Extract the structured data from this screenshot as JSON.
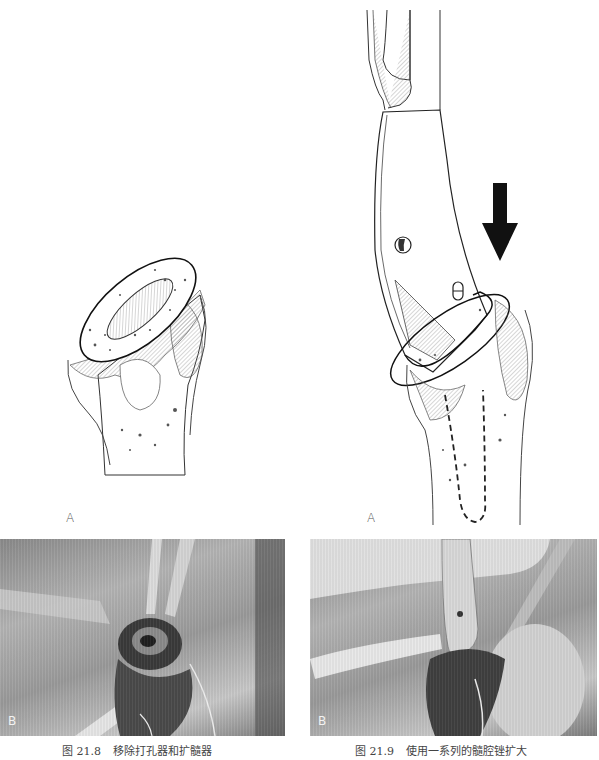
{
  "figures": [
    {
      "id": "21.8",
      "panel_a_label": "A",
      "panel_b_label": "B",
      "caption_prefix": "图 21.8",
      "caption_text": "移除打孔器和扩髓器",
      "drawing_subject": "proximal-humerus-bone-with-opened-canal",
      "photo_subject": "intraoperative-photo-reamer-removal"
    },
    {
      "id": "21.9",
      "panel_a_label": "A",
      "panel_b_label": "B",
      "caption_prefix": "图 21.9",
      "caption_text": "使用一系列的髓腔锉扩大",
      "drawing_subject": "broach-inserted-into-humerus-with-arrow",
      "photo_subject": "intraoperative-photo-broaching"
    }
  ],
  "colors": {
    "ink": "#1a1a1a",
    "hatch": "#777777",
    "photo_gray": "#9a9a9a",
    "caption": "#444444"
  }
}
